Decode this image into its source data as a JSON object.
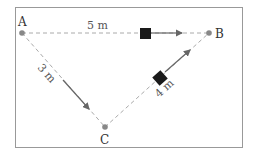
{
  "diagram": {
    "points": [
      {
        "name": "A",
        "x": 22,
        "y": 33
      },
      {
        "name": "B",
        "x": 209,
        "y": 33
      },
      {
        "name": "C",
        "x": 105,
        "y": 127
      }
    ],
    "edges": [
      {
        "from": "A",
        "to": "B",
        "length_label": "5 m"
      },
      {
        "from": "A",
        "to": "C",
        "length_label": "3 m"
      },
      {
        "from": "C",
        "to": "B",
        "length_label": "4 m"
      }
    ],
    "labels": {
      "A": "A",
      "B": "B",
      "C": "C",
      "ab": "5 m",
      "ac": "3 m",
      "cb": "4 m"
    },
    "colors": {
      "frame": "#888888",
      "dashed_line": "#aaaaaa",
      "point": "#888888",
      "block": "#1a1a1a",
      "arrow": "#666666"
    }
  }
}
